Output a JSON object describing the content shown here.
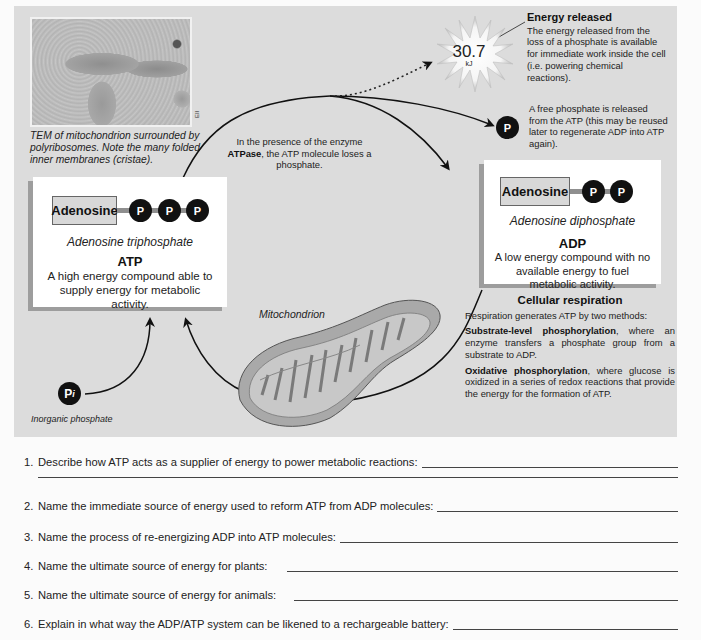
{
  "figure": {
    "tem_image": {
      "credit": "EII",
      "caption": "TEM of mitochondrion surrounded by polyribosomes. Note the many folded inner membranes (cristae)."
    },
    "enzyme_note": {
      "prefix": "In the presence of the enzyme ",
      "enzyme": "ATPase",
      "suffix": ", the ATP molecule loses a phosphate."
    },
    "energy_released": {
      "title": "Energy released",
      "text": "The energy released from the loss of a phosphate is available for immediate work inside the cell (i.e. powering chemical reactions).",
      "value": "30.7",
      "unit": "kJ"
    },
    "free_phosphate": {
      "symbol": "P",
      "text": "A free phosphate is released from the ATP (this may be reused later to regenerate ADP into ATP again)."
    },
    "atp": {
      "adenosine_label": "Adenosine",
      "phosphates": [
        "P",
        "P",
        "P"
      ],
      "full_name": "Adenosine triphosphate",
      "abbreviation": "ATP",
      "description": "A high energy compound able to supply energy for metabolic activity."
    },
    "adp": {
      "adenosine_label": "Adenosine",
      "phosphates": [
        "P",
        "P"
      ],
      "full_name": "Adenosine diphosphate",
      "abbreviation": "ADP",
      "description": "A low energy compound with no available energy to fuel metabolic activity."
    },
    "inorganic_phosphate": {
      "symbol": "P",
      "subscript": "i",
      "label": "Inorganic phosphate"
    },
    "mitochondrion_label": "Mitochondrion",
    "cellular_respiration": {
      "title": "Cellular respiration",
      "intro": "Respiration generates ATP by two methods:",
      "methods": [
        {
          "name": "Substrate-level phosphorylation",
          "text": ", where an enzyme transfers a phosphate group from a substrate to ADP."
        },
        {
          "name": "Oxidative phosphorylation",
          "text": ", where glucose is oxidized in a series of redox reactions that provide the energy for the formation of ATP."
        }
      ]
    }
  },
  "questions": [
    {
      "number": "1.",
      "text": "Describe how ATP acts as a supplier of energy to power metabolic reactions:"
    },
    {
      "number": "2.",
      "text": "Name the immediate source of energy used to reform ATP from ADP molecules:"
    },
    {
      "number": "3.",
      "text": "Name the process of re-energizing ADP into ATP molecules:"
    },
    {
      "number": "4.",
      "text": "Name the ultimate source of energy for plants:"
    },
    {
      "number": "5.",
      "text": "Name the ultimate source of energy for animals:"
    },
    {
      "number": "6.",
      "text": "Explain in what way the ADP/ATP system can be likened to a rechargeable battery:"
    }
  ]
}
